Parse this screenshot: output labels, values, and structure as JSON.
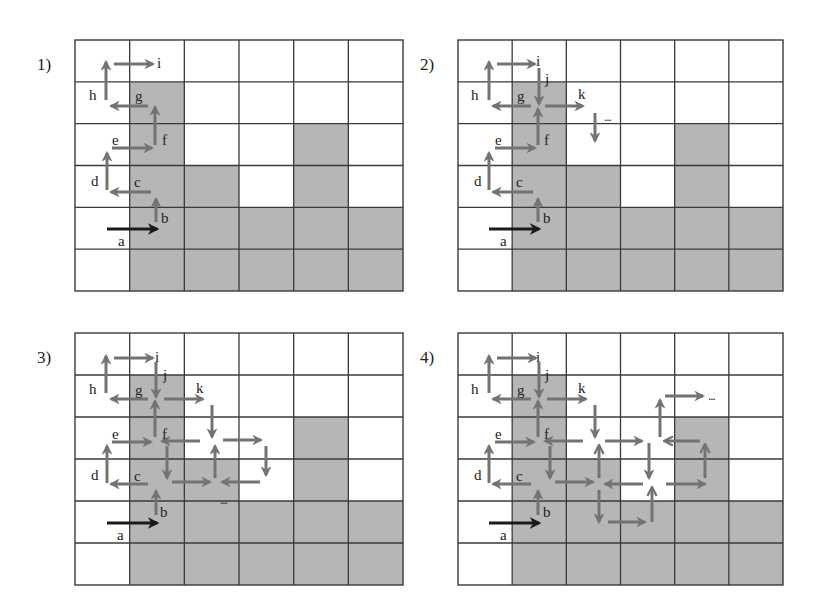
{
  "figure": {
    "colors": {
      "shaded_cell": "#b6b6b6",
      "grid_line": "#3a3a3a",
      "arrow": "#737373",
      "start_arrow": "#1a1a1a",
      "text": "#222222"
    },
    "grid": {
      "rows": 6,
      "cols": 6,
      "shaded_cells": [
        [
          1,
          1
        ],
        [
          2,
          1
        ],
        [
          2,
          4
        ],
        [
          3,
          1
        ],
        [
          3,
          2
        ],
        [
          3,
          4
        ],
        [
          4,
          1
        ],
        [
          4,
          2
        ],
        [
          4,
          3
        ],
        [
          4,
          4
        ],
        [
          4,
          5
        ],
        [
          5,
          1
        ],
        [
          5,
          2
        ],
        [
          5,
          3
        ],
        [
          5,
          4
        ],
        [
          5,
          5
        ]
      ]
    },
    "panels": [
      {
        "label": "1)",
        "x": 75,
        "y": 40,
        "w": 328,
        "h": 251,
        "arrows": [
          {
            "x1": 107,
            "y1": 229,
            "x2": 157,
            "y2": 229,
            "type": "start"
          },
          {
            "x1": 156,
            "y1": 222,
            "x2": 156,
            "y2": 199
          },
          {
            "x1": 151,
            "y1": 192,
            "x2": 111,
            "y2": 192
          },
          {
            "x1": 107,
            "y1": 190,
            "x2": 107,
            "y2": 153
          },
          {
            "x1": 112,
            "y1": 148,
            "x2": 152,
            "y2": 148
          },
          {
            "x1": 155,
            "y1": 145,
            "x2": 155,
            "y2": 107
          },
          {
            "x1": 148,
            "y1": 106,
            "x2": 111,
            "y2": 106
          },
          {
            "x1": 106,
            "y1": 100,
            "x2": 106,
            "y2": 62
          },
          {
            "x1": 114,
            "y1": 64,
            "x2": 153,
            "y2": 64
          }
        ],
        "letters": [
          {
            "t": "a",
            "x": 118,
            "y": 246
          },
          {
            "t": "b",
            "x": 161,
            "y": 223
          },
          {
            "t": "c",
            "x": 134,
            "y": 187
          },
          {
            "t": "d",
            "x": 91,
            "y": 186
          },
          {
            "t": "e",
            "x": 112,
            "y": 145
          },
          {
            "t": "f",
            "x": 162,
            "y": 145
          },
          {
            "t": "g",
            "x": 135,
            "y": 101
          },
          {
            "t": "h",
            "x": 89,
            "y": 100
          },
          {
            "t": "i",
            "x": 157,
            "y": 68
          }
        ],
        "dots": []
      },
      {
        "label": "2)",
        "x": 458,
        "y": 40,
        "w": 325,
        "h": 251,
        "arrows": [
          {
            "x1": 489,
            "y1": 229,
            "x2": 539,
            "y2": 229,
            "type": "start"
          },
          {
            "x1": 538,
            "y1": 222,
            "x2": 538,
            "y2": 199
          },
          {
            "x1": 533,
            "y1": 192,
            "x2": 493,
            "y2": 192
          },
          {
            "x1": 489,
            "y1": 190,
            "x2": 489,
            "y2": 153
          },
          {
            "x1": 495,
            "y1": 148,
            "x2": 535,
            "y2": 148
          },
          {
            "x1": 538,
            "y1": 145,
            "x2": 538,
            "y2": 109
          },
          {
            "x1": 531,
            "y1": 106,
            "x2": 493,
            "y2": 106
          },
          {
            "x1": 489,
            "y1": 100,
            "x2": 489,
            "y2": 62
          },
          {
            "x1": 497,
            "y1": 64,
            "x2": 535,
            "y2": 64
          },
          {
            "x1": 539,
            "y1": 68,
            "x2": 539,
            "y2": 104
          },
          {
            "x1": 545,
            "y1": 106,
            "x2": 583,
            "y2": 106
          },
          {
            "x1": 595,
            "y1": 113,
            "x2": 595,
            "y2": 141
          }
        ],
        "letters": [
          {
            "t": "a",
            "x": 500,
            "y": 246
          },
          {
            "t": "b",
            "x": 543,
            "y": 223
          },
          {
            "t": "c",
            "x": 516,
            "y": 187
          },
          {
            "t": "d",
            "x": 474,
            "y": 186
          },
          {
            "t": "e",
            "x": 495,
            "y": 145
          },
          {
            "t": "f",
            "x": 544,
            "y": 145
          },
          {
            "t": "g",
            "x": 517,
            "y": 101
          },
          {
            "t": "h",
            "x": 471,
            "y": 100
          },
          {
            "t": "i",
            "x": 536,
            "y": 66
          },
          {
            "t": "j",
            "x": 545,
            "y": 84
          },
          {
            "t": "k",
            "x": 578,
            "y": 99
          }
        ],
        "dots": [
          {
            "x": 604,
            "y": 121
          }
        ]
      },
      {
        "label": "3)",
        "x": 75,
        "y": 333,
        "w": 328,
        "h": 252,
        "arrows": [
          {
            "x1": 107,
            "y1": 523,
            "x2": 157,
            "y2": 523,
            "type": "start"
          },
          {
            "x1": 156,
            "y1": 515,
            "x2": 156,
            "y2": 491
          },
          {
            "x1": 148,
            "y1": 484,
            "x2": 111,
            "y2": 484
          },
          {
            "x1": 107,
            "y1": 483,
            "x2": 107,
            "y2": 446
          },
          {
            "x1": 112,
            "y1": 442,
            "x2": 151,
            "y2": 442
          },
          {
            "x1": 155,
            "y1": 437,
            "x2": 155,
            "y2": 401
          },
          {
            "x1": 148,
            "y1": 399,
            "x2": 111,
            "y2": 399
          },
          {
            "x1": 106,
            "y1": 393,
            "x2": 106,
            "y2": 356
          },
          {
            "x1": 114,
            "y1": 358,
            "x2": 153,
            "y2": 358
          },
          {
            "x1": 156,
            "y1": 362,
            "x2": 156,
            "y2": 397
          },
          {
            "x1": 164,
            "y1": 399,
            "x2": 203,
            "y2": 399
          },
          {
            "x1": 212,
            "y1": 405,
            "x2": 212,
            "y2": 437
          },
          {
            "x1": 200,
            "y1": 441,
            "x2": 162,
            "y2": 441
          },
          {
            "x1": 167,
            "y1": 446,
            "x2": 167,
            "y2": 478
          },
          {
            "x1": 172,
            "y1": 482,
            "x2": 210,
            "y2": 482
          },
          {
            "x1": 215,
            "y1": 478,
            "x2": 215,
            "y2": 446
          },
          {
            "x1": 223,
            "y1": 440,
            "x2": 261,
            "y2": 440
          },
          {
            "x1": 266,
            "y1": 446,
            "x2": 266,
            "y2": 475
          },
          {
            "x1": 260,
            "y1": 482,
            "x2": 222,
            "y2": 482
          }
        ],
        "letters": [
          {
            "t": "a",
            "x": 117,
            "y": 540
          },
          {
            "t": "b",
            "x": 160,
            "y": 517
          },
          {
            "t": "c",
            "x": 134,
            "y": 481
          },
          {
            "t": "d",
            "x": 91,
            "y": 480
          },
          {
            "t": "e",
            "x": 112,
            "y": 439
          },
          {
            "t": "f",
            "x": 162,
            "y": 439
          },
          {
            "t": "g",
            "x": 135,
            "y": 395
          },
          {
            "t": "h",
            "x": 89,
            "y": 394
          },
          {
            "t": "i",
            "x": 155,
            "y": 362
          },
          {
            "t": "j",
            "x": 163,
            "y": 380
          },
          {
            "t": "k",
            "x": 196,
            "y": 393
          }
        ],
        "dots": [
          {
            "x": 220,
            "y": 504
          }
        ]
      },
      {
        "label": "4)",
        "x": 458,
        "y": 333,
        "w": 325,
        "h": 252,
        "arrows": [
          {
            "x1": 489,
            "y1": 523,
            "x2": 539,
            "y2": 523,
            "type": "start"
          },
          {
            "x1": 538,
            "y1": 515,
            "x2": 538,
            "y2": 491
          },
          {
            "x1": 531,
            "y1": 484,
            "x2": 493,
            "y2": 484
          },
          {
            "x1": 489,
            "y1": 483,
            "x2": 489,
            "y2": 446
          },
          {
            "x1": 495,
            "y1": 442,
            "x2": 534,
            "y2": 442
          },
          {
            "x1": 538,
            "y1": 437,
            "x2": 538,
            "y2": 401
          },
          {
            "x1": 531,
            "y1": 399,
            "x2": 493,
            "y2": 399
          },
          {
            "x1": 489,
            "y1": 393,
            "x2": 489,
            "y2": 356
          },
          {
            "x1": 497,
            "y1": 358,
            "x2": 536,
            "y2": 358
          },
          {
            "x1": 539,
            "y1": 362,
            "x2": 539,
            "y2": 397
          },
          {
            "x1": 547,
            "y1": 399,
            "x2": 586,
            "y2": 399
          },
          {
            "x1": 595,
            "y1": 405,
            "x2": 595,
            "y2": 437
          },
          {
            "x1": 583,
            "y1": 441,
            "x2": 545,
            "y2": 441
          },
          {
            "x1": 550,
            "y1": 446,
            "x2": 550,
            "y2": 478
          },
          {
            "x1": 555,
            "y1": 482,
            "x2": 593,
            "y2": 482
          },
          {
            "x1": 599,
            "y1": 478,
            "x2": 599,
            "y2": 446,
            "hollow": true
          },
          {
            "x1": 605,
            "y1": 441,
            "x2": 642,
            "y2": 441
          },
          {
            "x1": 649,
            "y1": 443,
            "x2": 649,
            "y2": 478
          },
          {
            "x1": 643,
            "y1": 484,
            "x2": 605,
            "y2": 484
          },
          {
            "x1": 599,
            "y1": 490,
            "x2": 599,
            "y2": 522
          },
          {
            "x1": 608,
            "y1": 522,
            "x2": 645,
            "y2": 522
          },
          {
            "x1": 652,
            "y1": 522,
            "x2": 652,
            "y2": 488,
            "hollow": true
          },
          {
            "x1": 666,
            "y1": 484,
            "x2": 705,
            "y2": 484
          },
          {
            "x1": 705,
            "y1": 478,
            "x2": 705,
            "y2": 445,
            "hollow": true
          },
          {
            "x1": 700,
            "y1": 441,
            "x2": 665,
            "y2": 441,
            "hollow": true
          },
          {
            "x1": 660,
            "y1": 437,
            "x2": 660,
            "y2": 400
          },
          {
            "x1": 665,
            "y1": 396,
            "x2": 703,
            "y2": 396
          }
        ],
        "letters": [
          {
            "t": "a",
            "x": 500,
            "y": 540
          },
          {
            "t": "b",
            "x": 543,
            "y": 517
          },
          {
            "t": "c",
            "x": 516,
            "y": 481
          },
          {
            "t": "d",
            "x": 474,
            "y": 480
          },
          {
            "t": "e",
            "x": 495,
            "y": 439
          },
          {
            "t": "f",
            "x": 544,
            "y": 439
          },
          {
            "t": "g",
            "x": 517,
            "y": 395
          },
          {
            "t": "h",
            "x": 471,
            "y": 394
          },
          {
            "t": "i",
            "x": 536,
            "y": 362
          },
          {
            "t": "j",
            "x": 545,
            "y": 380
          },
          {
            "t": "k",
            "x": 578,
            "y": 393
          }
        ],
        "dots": [
          {
            "x": 708,
            "y": 400
          }
        ]
      }
    ],
    "dots_text": "..."
  }
}
